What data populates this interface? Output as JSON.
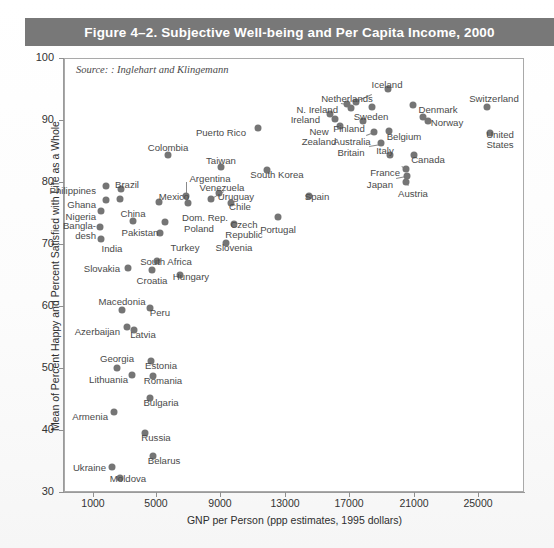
{
  "figure": {
    "title": "Figure 4–2. Subjective Well-being and Per Capita Income, 2000",
    "source_note": "Source: : Inglehart and Klingemann",
    "title_bar_color": "#787878",
    "point_color": "#757575"
  },
  "chart_data": {
    "type": "scatter",
    "title": "Figure 4–2. Subjective Well-being and Per Capita Income, 2000",
    "xlabel": "GNP per Person (ppp estimates, 1995 dollars)",
    "ylabel": "Mean of Percent Happy and Percent Satisfied with Life as a Whole",
    "xlim": [
      -1000,
      27000
    ],
    "ylim": [
      30,
      100
    ],
    "xticks": [
      1000,
      5000,
      9000,
      13000,
      17000,
      21000,
      25000
    ],
    "yticks": [
      30,
      40,
      50,
      60,
      70,
      80,
      90,
      100
    ],
    "grid": false,
    "legend": null,
    "annotation": "Source: : Inglehart and Klingemann",
    "points": [
      {
        "label": "Philippines",
        "x": 3300,
        "y": 80.3,
        "lx": 96,
        "ly": 186,
        "la": "r"
      },
      {
        "label": "Brazil",
        "x": 5600,
        "y": 79.5,
        "lx": 127,
        "ly": 180,
        "la": "c"
      },
      {
        "label": "Ghana",
        "x": 3000,
        "y": 77.5,
        "lx": 96,
        "ly": 200,
        "la": "r"
      },
      {
        "label": "Nigeria",
        "x": 2700,
        "y": 75.5,
        "lx": 96,
        "ly": 212,
        "la": "r"
      },
      {
        "label": "Bangla-",
        "x": 2500,
        "y": 73.5,
        "lx": 96,
        "ly": 221,
        "la": "r"
      },
      {
        "label": "desh",
        "x": null,
        "y": null,
        "lx": 96,
        "ly": 231,
        "la": "r"
      },
      {
        "label": "India",
        "x": 3000,
        "y": 70.5,
        "lx": 112,
        "ly": 244,
        "la": "c"
      },
      {
        "label": "China",
        "x": 4600,
        "y": 76.5,
        "lx": 133,
        "ly": 209,
        "la": "c"
      },
      {
        "label": "Pakistan",
        "x": 4400,
        "y": 72.5,
        "lx": 140,
        "ly": 228,
        "la": "c"
      },
      {
        "label": "Mexico",
        "x": 8400,
        "y": 78.0,
        "lx": 174,
        "ly": 192,
        "la": "c"
      },
      {
        "label": "Argentina",
        "x": 11500,
        "y": 79.0,
        "lx": 210,
        "ly": 174,
        "la": "c"
      },
      {
        "label": "Dom. Rep.",
        "x": 11500,
        "y": 77.0,
        "lx": 205,
        "ly": 213,
        "la": "c"
      },
      {
        "label": "Poland",
        "x": 9000,
        "y": 73.0,
        "lx": 199,
        "ly": 224,
        "la": "c"
      },
      {
        "label": "Turkey",
        "x": 8000,
        "y": 70.0,
        "lx": 185,
        "ly": 243,
        "la": "c"
      },
      {
        "label": "Colombia",
        "x": 7200,
        "y": 86.5,
        "lx": 168,
        "ly": 143,
        "la": "c"
      },
      {
        "label": "Taiwan",
        "x": 9200,
        "y": 83.5,
        "lx": 221,
        "ly": 156,
        "la": "c"
      },
      {
        "label": "Venezuela",
        "x": 11200,
        "y": 80.5,
        "lx": 222,
        "ly": 183,
        "la": "c"
      },
      {
        "label": "Uruguay",
        "x": 11000,
        "y": 78.5,
        "lx": 236,
        "ly": 192,
        "la": "c"
      },
      {
        "label": "Chile",
        "x": 12000,
        "y": 77.5,
        "lx": 240,
        "ly": 202,
        "la": "c"
      },
      {
        "label": "Czech",
        "x": 13500,
        "y": 74.0,
        "lx": 244,
        "ly": 220,
        "la": "c"
      },
      {
        "label": "Republic",
        "x": null,
        "y": null,
        "lx": 244,
        "ly": 230,
        "la": "c"
      },
      {
        "label": "Slovenia",
        "x": 14500,
        "y": 70.5,
        "lx": 234,
        "ly": 243,
        "la": "c"
      },
      {
        "label": "Puerto Rico",
        "x": 12000,
        "y": 88.0,
        "lx": 246,
        "ly": 128,
        "la": "r"
      },
      {
        "label": "South Korea",
        "x": 13000,
        "y": 82.5,
        "lx": 277,
        "ly": 170,
        "la": "c"
      },
      {
        "label": "Spain",
        "x": 16000,
        "y": 76.5,
        "lx": 317,
        "ly": 192,
        "la": "c"
      },
      {
        "label": "Portugal",
        "x": 14500,
        "y": 74.0,
        "lx": 278,
        "ly": 225,
        "la": "c"
      },
      {
        "label": "South Africa",
        "x": 9200,
        "y": 67.0,
        "lx": 166,
        "ly": 257,
        "la": "c"
      },
      {
        "label": "Croatia",
        "x": 9000,
        "y": 65.5,
        "lx": 152,
        "ly": 276,
        "la": "c"
      },
      {
        "label": "Hungary",
        "x": 11000,
        "y": 65.0,
        "lx": 191,
        "ly": 272,
        "la": "c"
      },
      {
        "label": "Slovakia",
        "x": 7000,
        "y": 66.0,
        "lx": 120,
        "ly": 264,
        "la": "r"
      },
      {
        "label": "Macedonia",
        "x": 6500,
        "y": 60.5,
        "lx": 122,
        "ly": 297,
        "la": "c"
      },
      {
        "label": "Peru",
        "x": 9200,
        "y": 60.0,
        "lx": 160,
        "ly": 308,
        "la": "c"
      },
      {
        "label": "Azerbaijan",
        "x": 5700,
        "y": 57.0,
        "lx": 120,
        "ly": 327,
        "la": "r"
      },
      {
        "label": "Latvia",
        "x": 7000,
        "y": 56.5,
        "lx": 143,
        "ly": 330,
        "la": "c"
      },
      {
        "label": "Georgia",
        "x": 5400,
        "y": 51.5,
        "lx": 117,
        "ly": 354,
        "la": "c"
      },
      {
        "label": "Estonia",
        "x": 9200,
        "y": 52.0,
        "lx": 161,
        "ly": 361,
        "la": "c"
      },
      {
        "label": "Lithuania",
        "x": 7000,
        "y": 50.0,
        "lx": 128,
        "ly": 375,
        "la": "r"
      },
      {
        "label": "Romania",
        "x": 9000,
        "y": 49.5,
        "lx": 163,
        "ly": 376,
        "la": "c"
      },
      {
        "label": "Bulgaria",
        "x": 8500,
        "y": 46.5,
        "lx": 161,
        "ly": 398,
        "la": "c"
      },
      {
        "label": "Armenia",
        "x": 4800,
        "y": 43.0,
        "lx": 108,
        "ly": 412,
        "la": "r"
      },
      {
        "label": "Russia",
        "x": 9000,
        "y": 40.5,
        "lx": 156,
        "ly": 433,
        "la": "c"
      },
      {
        "label": "Belarus",
        "x": 8200,
        "y": 35.5,
        "lx": 164,
        "ly": 456,
        "la": "c"
      },
      {
        "label": "Ukraine",
        "x": 6000,
        "y": 34.5,
        "lx": 106,
        "ly": 463,
        "la": "r"
      },
      {
        "label": "Moldova",
        "x": 6500,
        "y": 33.0,
        "lx": 128,
        "ly": 474,
        "la": "c"
      },
      {
        "label": "Netherlands",
        "x": 17800,
        "y": 91.5,
        "lx": 347,
        "ly": 94,
        "la": "c"
      },
      {
        "label": "Iceland",
        "x": 19200,
        "y": 93.0,
        "lx": 387,
        "ly": 80,
        "la": "c"
      },
      {
        "label": "N. Ireland",
        "x": 16800,
        "y": 91.0,
        "lx": 338,
        "ly": 105,
        "la": "r"
      },
      {
        "label": "Ireland",
        "x": 16000,
        "y": 90.0,
        "lx": 320,
        "ly": 115,
        "la": "r"
      },
      {
        "label": "Sweden",
        "x": 18200,
        "y": 90.5,
        "lx": 371,
        "ly": 112,
        "la": "c"
      },
      {
        "label": "Denmark",
        "x": 20800,
        "y": 91.0,
        "lx": 438,
        "ly": 105,
        "la": "c"
      },
      {
        "label": "Switzerland",
        "x": 25000,
        "y": 91.5,
        "lx": 494,
        "ly": 94,
        "la": "c"
      },
      {
        "label": "Finland",
        "x": 17300,
        "y": 89.5,
        "lx": 349,
        "ly": 124,
        "la": "c"
      },
      {
        "label": "Norway",
        "x": 21000,
        "y": 89.5,
        "lx": 447,
        "ly": 118,
        "la": "c"
      },
      {
        "label": "New",
        "x": 16200,
        "y": 88.0,
        "lx": 319,
        "ly": 127,
        "la": "c"
      },
      {
        "label": "Zealand",
        "x": null,
        "y": null,
        "lx": 319,
        "ly": 137,
        "la": "c"
      },
      {
        "label": "Australia",
        "x": 18000,
        "y": 87.5,
        "lx": 352,
        "ly": 137,
        "la": "c"
      },
      {
        "label": "Belgium",
        "x": 19800,
        "y": 88.0,
        "lx": 404,
        "ly": 132,
        "la": "c"
      },
      {
        "label": "Britain",
        "x": 18400,
        "y": 86.5,
        "lx": 351,
        "ly": 148,
        "la": "c"
      },
      {
        "label": "Italy",
        "x": 19200,
        "y": 84.5,
        "lx": 385,
        "ly": 146,
        "la": "c"
      },
      {
        "label": "Canada",
        "x": 20600,
        "y": 84.0,
        "lx": 428,
        "ly": 155,
        "la": "c"
      },
      {
        "label": "United",
        "x": 25400,
        "y": 87.0,
        "lx": 500,
        "ly": 130,
        "la": "c"
      },
      {
        "label": "States",
        "x": null,
        "y": null,
        "lx": 500,
        "ly": 140,
        "la": "c"
      },
      {
        "label": "France",
        "x": 19800,
        "y": 82.5,
        "lx": 400,
        "ly": 168,
        "la": "r"
      },
      {
        "label": "Japan",
        "x": 19900,
        "y": 81.0,
        "lx": 393,
        "ly": 180,
        "la": "r"
      },
      {
        "label": "Austria",
        "x": 20100,
        "y": 80.5,
        "lx": 413,
        "ly": 189,
        "la": "c"
      }
    ]
  },
  "dots": [
    {
      "n": "philippines",
      "x": 106,
      "y": 186
    },
    {
      "n": "brazil",
      "x": 121,
      "y": 189
    },
    {
      "n": "ghana",
      "x": 106,
      "y": 200
    },
    {
      "n": "nigeria",
      "x": 101,
      "y": 211
    },
    {
      "n": "bangladesh",
      "x": 100,
      "y": 227
    },
    {
      "n": "india",
      "x": 101,
      "y": 239
    },
    {
      "n": "china",
      "x": 120,
      "y": 199
    },
    {
      "n": "pakistan",
      "x": 133,
      "y": 221
    },
    {
      "n": "mexico",
      "x": 159,
      "y": 202
    },
    {
      "n": "argentina",
      "x": 186,
      "y": 196
    },
    {
      "n": "dom-rep",
      "x": 188,
      "y": 203
    },
    {
      "n": "poland",
      "x": 165,
      "y": 222
    },
    {
      "n": "turkey",
      "x": 160,
      "y": 233
    },
    {
      "n": "colombia",
      "x": 168,
      "y": 155
    },
    {
      "n": "taiwan",
      "x": 221,
      "y": 167
    },
    {
      "n": "venezuela",
      "x": 219,
      "y": 193
    },
    {
      "n": "uruguay",
      "x": 211,
      "y": 199
    },
    {
      "n": "chile",
      "x": 231,
      "y": 203
    },
    {
      "n": "czech-rep",
      "x": 234,
      "y": 224
    },
    {
      "n": "slovenia",
      "x": 226,
      "y": 243
    },
    {
      "n": "puerto-rico",
      "x": 258,
      "y": 128
    },
    {
      "n": "south-korea",
      "x": 267,
      "y": 170
    },
    {
      "n": "spain",
      "x": 309,
      "y": 196
    },
    {
      "n": "portugal",
      "x": 278,
      "y": 217
    },
    {
      "n": "south-africa",
      "x": 157,
      "y": 261
    },
    {
      "n": "croatia",
      "x": 152,
      "y": 270
    },
    {
      "n": "hungary",
      "x": 180,
      "y": 275
    },
    {
      "n": "slovakia",
      "x": 128,
      "y": 268
    },
    {
      "n": "macedonia",
      "x": 122,
      "y": 310
    },
    {
      "n": "peru",
      "x": 150,
      "y": 308
    },
    {
      "n": "azerbaijan",
      "x": 127,
      "y": 327
    },
    {
      "n": "latvia",
      "x": 134,
      "y": 330
    },
    {
      "n": "georgia",
      "x": 117,
      "y": 368
    },
    {
      "n": "estonia",
      "x": 151,
      "y": 361
    },
    {
      "n": "lithuania",
      "x": 132,
      "y": 375
    },
    {
      "n": "romania",
      "x": 153,
      "y": 376
    },
    {
      "n": "bulgaria",
      "x": 150,
      "y": 398
    },
    {
      "n": "armenia",
      "x": 114,
      "y": 412
    },
    {
      "n": "russia",
      "x": 145,
      "y": 433
    },
    {
      "n": "belarus",
      "x": 153,
      "y": 456
    },
    {
      "n": "ukraine",
      "x": 112,
      "y": 467
    },
    {
      "n": "moldova",
      "x": 120,
      "y": 478
    },
    {
      "n": "netherlands",
      "x": 356,
      "y": 102
    },
    {
      "n": "iceland",
      "x": 388,
      "y": 89
    },
    {
      "n": "n-ireland",
      "x": 347,
      "y": 104
    },
    {
      "n": "n-ireland-b",
      "x": 351,
      "y": 108
    },
    {
      "n": "ireland",
      "x": 330,
      "y": 114
    },
    {
      "n": "ireland-b",
      "x": 335,
      "y": 119
    },
    {
      "n": "sweden",
      "x": 372,
      "y": 107
    },
    {
      "n": "denmark",
      "x": 413,
      "y": 105
    },
    {
      "n": "switzerland",
      "x": 487,
      "y": 107
    },
    {
      "n": "finland",
      "x": 363,
      "y": 121
    },
    {
      "n": "norway",
      "x": 423,
      "y": 117
    },
    {
      "n": "norway-b",
      "x": 428,
      "y": 121
    },
    {
      "n": "new-zealand",
      "x": 340,
      "y": 126
    },
    {
      "n": "australia",
      "x": 374,
      "y": 132
    },
    {
      "n": "belgium",
      "x": 389,
      "y": 131
    },
    {
      "n": "britain",
      "x": 381,
      "y": 143
    },
    {
      "n": "italy",
      "x": 390,
      "y": 155
    },
    {
      "n": "canada",
      "x": 414,
      "y": 155
    },
    {
      "n": "united-states",
      "x": 490,
      "y": 133
    },
    {
      "n": "france",
      "x": 406,
      "y": 169
    },
    {
      "n": "japan",
      "x": 407,
      "y": 176
    },
    {
      "n": "austria",
      "x": 406,
      "y": 182
    }
  ],
  "leaders": [
    {
      "n": "argentina-leader",
      "x1": 187,
      "y1": 182,
      "x2": 187,
      "y2": 196
    },
    {
      "n": "uruguay-leader",
      "x1": 224,
      "y1": 192,
      "x2": 212,
      "y2": 199
    },
    {
      "n": "australia-leader",
      "x1": 366,
      "y1": 135,
      "x2": 374,
      "y2": 132
    },
    {
      "n": "britain-leader",
      "x1": 369,
      "y1": 146,
      "x2": 381,
      "y2": 144
    },
    {
      "n": "france-leader",
      "x1": 402,
      "y1": 166,
      "x2": 406,
      "y2": 169
    },
    {
      "n": "japan-leader",
      "x1": 396,
      "y1": 178,
      "x2": 406,
      "y2": 176
    },
    {
      "n": "austria-leader",
      "x1": 408,
      "y1": 186,
      "x2": 406,
      "y2": 183
    },
    {
      "n": "n-ireland-leader",
      "x1": 341,
      "y1": 103,
      "x2": 347,
      "y2": 104
    },
    {
      "n": "netherlands-leader",
      "x1": 372,
      "y1": 95,
      "x2": 358,
      "y2": 101
    }
  ],
  "axes": {
    "y_title": "Mean of Percent Happy and Percent Satisfied with Life as a Whole",
    "x_title": "GNP per Person (ppp estimates, 1995 dollars)",
    "y_ticks": [
      {
        "v": "100",
        "py": 58
      },
      {
        "v": "90",
        "py": 120
      },
      {
        "v": "80",
        "py": 182
      },
      {
        "v": "70",
        "py": 244
      },
      {
        "v": "60",
        "py": 306
      },
      {
        "v": "50",
        "py": 368
      },
      {
        "v": "40",
        "py": 430
      },
      {
        "v": "30",
        "py": 492
      }
    ],
    "x_ticks": [
      {
        "v": "1000",
        "px": 93
      },
      {
        "v": "5000",
        "px": 156
      },
      {
        "v": "9000",
        "px": 220
      },
      {
        "v": "13000",
        "px": 285
      },
      {
        "v": "17000",
        "px": 349
      },
      {
        "v": "21000",
        "px": 414
      },
      {
        "v": "25000",
        "px": 478
      }
    ]
  }
}
